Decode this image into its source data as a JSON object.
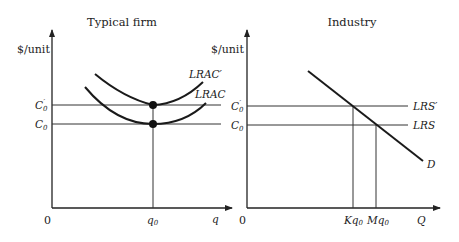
{
  "left_panel": {
    "title": "Typical firm",
    "y_axis_label": "$/unit",
    "origin_label": "0",
    "x_axis_label": "q",
    "x_tick_label": "q",
    "x_tick_sub": "0",
    "y_tick_upper": {
      "main": "C",
      "sub": "0",
      "prime": "′"
    },
    "y_tick_lower": {
      "main": "C",
      "sub": "0"
    },
    "curve_upper_label": "LRAC′",
    "curve_lower_label": "LRAC"
  },
  "right_panel": {
    "title": "Industry",
    "y_axis_label": "$/unit",
    "origin_label": "0",
    "x_axis_label": "Q",
    "x_tick_1": {
      "pre": "Kq",
      "sub": "0"
    },
    "x_tick_2": {
      "pre": "Mq",
      "sub": "0"
    },
    "y_tick_upper": {
      "main": "C",
      "sub": "0",
      "prime": "′"
    },
    "y_tick_lower": {
      "main": "C",
      "sub": "0"
    },
    "line_upper_label": "LRS′",
    "line_lower_label": "LRS",
    "demand_label": "D"
  }
}
